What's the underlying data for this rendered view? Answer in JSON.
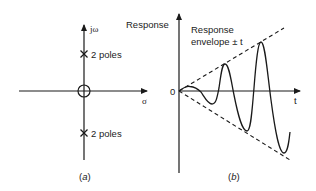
{
  "panel_a": {
    "imag_axis_label": "jω",
    "real_axis_label": "σ",
    "upper_pole_label": "2 poles",
    "lower_pole_label": "2 poles",
    "caption_open": "(",
    "caption_letter": "a",
    "caption_close": ")"
  },
  "panel_b": {
    "y_axis_label": "Response",
    "x_axis_label": "t",
    "origin_label": "0",
    "envelope_label_line1": "Response",
    "envelope_label_line2": "envelope ± t",
    "caption_open": "(",
    "caption_letter": "b",
    "caption_close": ")"
  },
  "colors": {
    "ink": "#1a1a1a",
    "background": "#ffffff"
  }
}
